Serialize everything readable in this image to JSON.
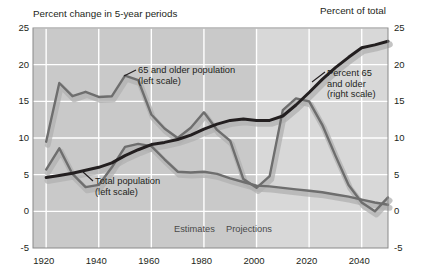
{
  "titles": {
    "left": "Percent change in 5-year periods",
    "right": "Percent of total"
  },
  "annotations": {
    "older_pop_line1": "65 and older population",
    "older_pop_line2": "(left scale)",
    "total_pop_line1": "Total population",
    "total_pop_line2": "(left scale)",
    "percent65_line1": "Percent 65",
    "percent65_line2": "and older",
    "percent65_line3": "(right scale)",
    "estimates": "Estimates",
    "projections": "Projections"
  },
  "colors": {
    "plot_background": "#c9c9c9",
    "projection_background": "#d8d8d8",
    "gridline": "#ffffff",
    "series_dark": "#231f20",
    "series_mid": "#6e6e6e",
    "shadow": "#b0b0b0",
    "text": "#231f20"
  },
  "axes": {
    "x_ticks": [
      "1920",
      "1940",
      "1960",
      "1980",
      "2000",
      "2020",
      "2040"
    ],
    "x_tick_values": [
      1920,
      1940,
      1960,
      1980,
      2000,
      2020,
      2040
    ],
    "xlim": [
      1915,
      2050
    ],
    "y_left_ticks": [
      "25",
      "20",
      "15",
      "10",
      "5",
      "0",
      "-5"
    ],
    "y_right_ticks": [
      "25",
      "20",
      "15",
      "10",
      "5",
      "0",
      "-5"
    ],
    "y_tick_values": [
      25,
      20,
      15,
      10,
      5,
      0,
      -5
    ],
    "ylim": [
      -5,
      25
    ],
    "estimates_projection_split": 2000
  },
  "chart_data": {
    "type": "line",
    "xlabel": "",
    "ylabel": "Percent change in 5-year periods",
    "ylabel_right": "Percent of total",
    "xlim": [
      1915,
      2050
    ],
    "ylim": [
      -5,
      25
    ],
    "grid": true,
    "legend": "annotations-on-plot",
    "x": [
      1920,
      1925,
      1930,
      1935,
      1940,
      1945,
      1950,
      1955,
      1960,
      1965,
      1970,
      1975,
      1980,
      1985,
      1990,
      1995,
      2000,
      2005,
      2010,
      2015,
      2020,
      2025,
      2030,
      2035,
      2040,
      2045,
      2050
    ],
    "series": [
      {
        "name": "65 and older population (left scale)",
        "axis": "left",
        "units": "percent change in 5-year period",
        "values": [
          9.5,
          17.5,
          15.7,
          16.3,
          15.6,
          15.7,
          18.5,
          17.9,
          13.2,
          11.3,
          10.0,
          11.4,
          13.5,
          11.1,
          9.6,
          4.4,
          3.2,
          4.8,
          13.8,
          15.4,
          15.0,
          11.8,
          7.6,
          3.6,
          1.2,
          0.0,
          1.9
        ]
      },
      {
        "name": "Total population (left scale)",
        "axis": "left",
        "units": "percent change in 5-year period",
        "values": [
          5.7,
          8.6,
          5.1,
          3.3,
          3.6,
          6.0,
          8.8,
          9.2,
          8.9,
          7.1,
          5.4,
          5.3,
          5.4,
          5.1,
          4.5,
          4.0,
          3.5,
          3.4,
          3.2,
          3.0,
          2.8,
          2.6,
          2.3,
          2.0,
          1.6,
          1.2,
          0.9
        ]
      },
      {
        "name": "Percent 65 and older (right scale)",
        "axis": "right",
        "units": "percent of total population",
        "values": [
          4.6,
          4.9,
          5.2,
          5.6,
          6.0,
          6.6,
          7.6,
          8.4,
          9.1,
          9.4,
          9.8,
          10.4,
          11.2,
          11.9,
          12.4,
          12.6,
          12.4,
          12.4,
          13.0,
          14.5,
          16.2,
          18.0,
          19.6,
          21.0,
          22.3,
          22.7,
          23.2
        ]
      }
    ],
    "annotations": [
      {
        "text": "Estimates",
        "x": 1987,
        "y": -3.6
      },
      {
        "text": "Projections",
        "x": 2007,
        "y": -3.6
      }
    ]
  }
}
